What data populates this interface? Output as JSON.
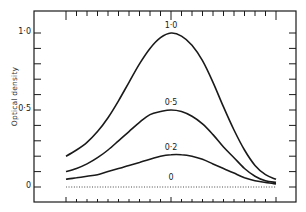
{
  "chart_data": {
    "type": "line",
    "title": "",
    "xlabel": "",
    "ylabel": "Optical density",
    "ylim": [
      0,
      1.0
    ],
    "yticks": [
      {
        "value": 0,
        "label": "0"
      },
      {
        "value": 0.5,
        "label": "0·5"
      },
      {
        "value": 1.0,
        "label": "1·0"
      }
    ],
    "y_minor_tick_step": 0.1,
    "x_tick_count": 21,
    "x_major_ticks": [
      0,
      10,
      20
    ],
    "grid": false,
    "legend": "none (curves labeled inline at peaks)",
    "x": [
      0,
      1,
      2,
      3,
      4,
      5,
      6,
      7,
      8,
      9,
      10,
      11,
      12,
      13,
      14,
      15,
      16,
      17,
      18,
      19,
      20
    ],
    "series": [
      {
        "name": "1·0",
        "label": "1·0",
        "style": "solid",
        "values": [
          0.2,
          0.24,
          0.29,
          0.36,
          0.45,
          0.56,
          0.68,
          0.8,
          0.9,
          0.97,
          1.0,
          0.98,
          0.92,
          0.82,
          0.68,
          0.52,
          0.37,
          0.24,
          0.14,
          0.08,
          0.05
        ]
      },
      {
        "name": "0·5",
        "label": "0·5",
        "style": "solid",
        "values": [
          0.1,
          0.12,
          0.15,
          0.19,
          0.24,
          0.3,
          0.36,
          0.42,
          0.47,
          0.49,
          0.5,
          0.49,
          0.46,
          0.41,
          0.34,
          0.26,
          0.19,
          0.12,
          0.07,
          0.04,
          0.03
        ]
      },
      {
        "name": "0·2",
        "label": "0·2",
        "style": "solid",
        "values": [
          0.05,
          0.06,
          0.07,
          0.08,
          0.1,
          0.12,
          0.14,
          0.16,
          0.18,
          0.2,
          0.21,
          0.21,
          0.2,
          0.18,
          0.15,
          0.12,
          0.09,
          0.06,
          0.04,
          0.03,
          0.02
        ]
      },
      {
        "name": "0",
        "label": "0",
        "style": "dotted",
        "values": [
          0,
          0,
          0,
          0,
          0,
          0,
          0,
          0,
          0,
          0,
          0,
          0,
          0,
          0,
          0,
          0,
          0,
          0,
          0,
          0,
          0
        ]
      }
    ]
  },
  "colors": {
    "ink": "#1a1a1a",
    "background": "#ffffff"
  }
}
